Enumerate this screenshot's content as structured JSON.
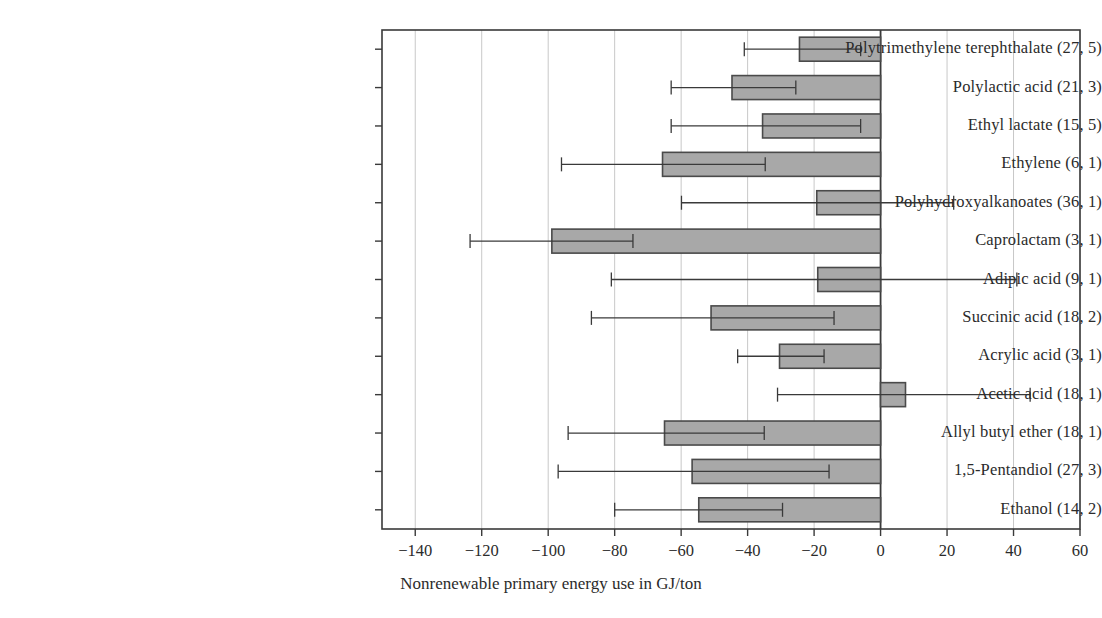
{
  "chart_data": {
    "type": "bar",
    "orientation": "horizontal",
    "title": "",
    "xlabel": "Nonrenewable primary energy use in GJ/ton",
    "ylabel": "",
    "xlim": [
      -150,
      60
    ],
    "xticks": [
      -140,
      -120,
      -100,
      -80,
      -60,
      -40,
      -20,
      0,
      20,
      40,
      60
    ],
    "xticklabels": [
      "−140",
      "−120",
      "−100",
      "−80",
      "−60",
      "−40",
      "−20",
      "0",
      "20",
      "40",
      "60"
    ],
    "grid": "vertical",
    "legend": null,
    "bar_fill": "#a8a8a8",
    "bar_edge": "#4a4a4a",
    "error_bar_color": "#3a3a3a",
    "axis_color": "#3a3a3a",
    "grid_color": "#c8c8c8",
    "categories": [
      "Polytrimethylene terephthalate (27, 5)",
      "Polylactic acid (21, 3)",
      "Ethyl lactate (15, 5)",
      "Ethylene (6, 1)",
      "Polyhydroxyalkanoates (36, 1)",
      "Caprolactam (3, 1)",
      "Adipic acid (9, 1)",
      "Succinic acid (18, 2)",
      "Acrylic acid (3, 1)",
      "Acetic acid (18, 1)",
      "Allyl butyl ether (18, 1)",
      "1,5-Pentandiol (27, 3)",
      "Ethanol (14, 2)"
    ],
    "values": [
      -24.4,
      -44.7,
      -35.5,
      -65.6,
      -19.2,
      -98.9,
      -18.9,
      -51.0,
      -30.4,
      7.5,
      -65.0,
      -56.7,
      -54.7
    ],
    "error_low": [
      -41.0,
      -63.0,
      -63.0,
      -96.0,
      -59.9,
      -123.5,
      -81.0,
      -87.0,
      -43.0,
      -31.0,
      -94.0,
      -97.0,
      -80.0
    ],
    "error_high": [
      -6.0,
      -25.5,
      -6.0,
      -34.7,
      22.0,
      -74.5,
      41.0,
      -14.0,
      -17.0,
      45.0,
      -35.0,
      -15.5,
      -29.5
    ]
  }
}
